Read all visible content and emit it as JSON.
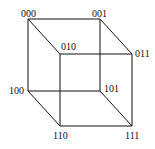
{
  "diagram": {
    "type": "cube",
    "vertices": [
      {
        "label": "000",
        "x": 28,
        "y": 19,
        "lx": 21,
        "ly": 9
      },
      {
        "label": "001",
        "x": 100,
        "y": 19,
        "lx": 92,
        "ly": 9
      },
      {
        "label": "010",
        "x": 60,
        "y": 54,
        "lx": 61,
        "ly": 42
      },
      {
        "label": "011",
        "x": 132,
        "y": 54,
        "lx": 135,
        "ly": 49
      },
      {
        "label": "100",
        "x": 28,
        "y": 91,
        "lx": 9,
        "ly": 86
      },
      {
        "label": "101",
        "x": 100,
        "y": 91,
        "lx": 104,
        "ly": 84
      },
      {
        "label": "110",
        "x": 60,
        "y": 126,
        "lx": 53,
        "ly": 131
      },
      {
        "label": "111",
        "x": 132,
        "y": 126,
        "lx": 125,
        "ly": 131
      }
    ],
    "edges": [
      [
        "000",
        "001"
      ],
      [
        "000",
        "010"
      ],
      [
        "000",
        "100"
      ],
      [
        "001",
        "011"
      ],
      [
        "001",
        "101"
      ],
      [
        "010",
        "011"
      ],
      [
        "010",
        "110"
      ],
      [
        "011",
        "111"
      ],
      [
        "100",
        "101"
      ],
      [
        "100",
        "110"
      ],
      [
        "101",
        "111"
      ],
      [
        "110",
        "111"
      ]
    ],
    "line_color": "#111111"
  }
}
